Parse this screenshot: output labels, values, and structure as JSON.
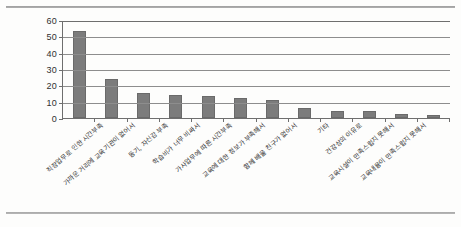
{
  "chart_data": {
    "type": "bar",
    "title": "",
    "subtitle": "",
    "xlabel": "",
    "ylabel": "",
    "ylim": [
      0,
      60
    ],
    "ytick_labels": [
      "60",
      "50",
      "40",
      "30",
      "20",
      "10",
      "0"
    ],
    "ytick_values": [
      60,
      50,
      40,
      30,
      20,
      10,
      0
    ],
    "grid": true,
    "legend": "none",
    "bar_color": "#7c7c7c",
    "categories": [
      "직장업무로 인한 시간부족",
      "가까운 거리에 교육기관이 없어서",
      "동기, 자신감 부족",
      "학습비가 너무 비싸서",
      "가사업무에 따른 시간부족",
      "교육에 대한 정보가 부족해서",
      "함께 배울 친구가 없어서",
      "기타",
      "건강상의 이유로",
      "교육시설이 만족스럽지 못해서",
      "교육내용이 만족스럽지 못해서",
      ""
    ],
    "values": [
      53,
      24,
      15.5,
      14,
      13.5,
      12,
      11,
      6,
      4.5,
      4,
      2.5,
      2
    ]
  },
  "colors": {
    "bar": "#7c7c7c",
    "axis": "#6e6e6e",
    "grid": "#8d8d8d",
    "text": "#2f2f2f",
    "background": "#fdfdfc"
  }
}
